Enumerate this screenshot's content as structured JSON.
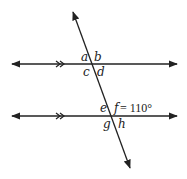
{
  "diagram": {
    "parallel_marker": "double-chevron",
    "angles": {
      "top_intersection": [
        "a",
        "b",
        "c",
        "d"
      ],
      "bottom_intersection": [
        "e",
        "f",
        "g",
        "h"
      ]
    },
    "labels": {
      "a": "a",
      "b": "b",
      "c": "c",
      "d": "d",
      "e": "e",
      "f": "f",
      "g": "g",
      "h": "h",
      "f_value": "= 110°"
    },
    "given": {
      "angle": "f",
      "measure_degrees": 110
    },
    "colors": {
      "stroke": "#222222",
      "background": "#ffffff"
    }
  }
}
